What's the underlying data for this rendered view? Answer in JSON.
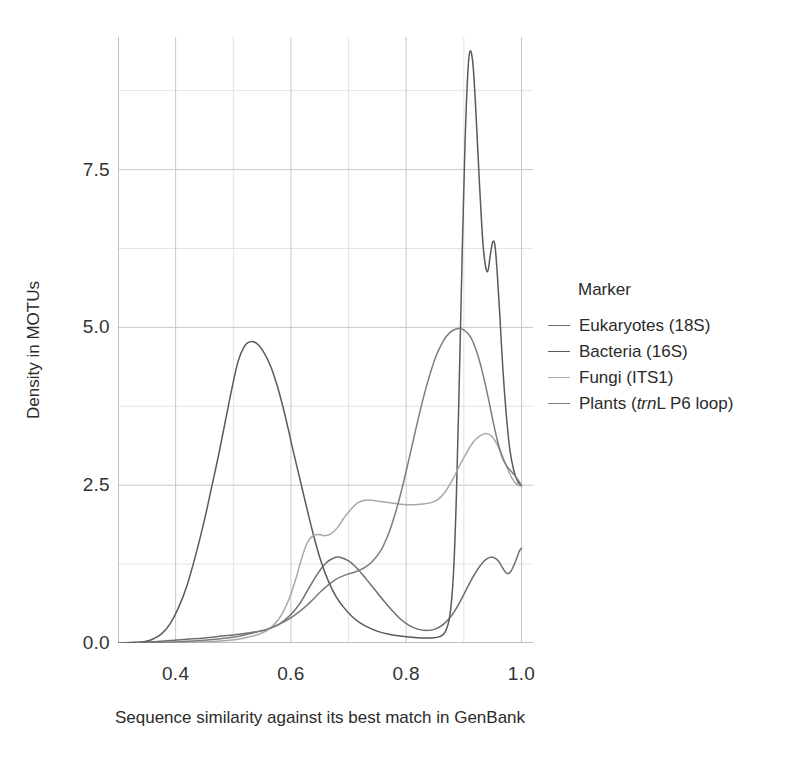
{
  "chart_data": {
    "type": "line",
    "title": "",
    "xlabel": "Sequence similarity against its best match in GenBank",
    "ylabel": "Density in MOTUs",
    "xlim": [
      0.3,
      1.02
    ],
    "ylim": [
      0.0,
      9.6
    ],
    "xticks": [
      0.4,
      0.6,
      0.8,
      1.0
    ],
    "xtick_labels": [
      "0.4",
      "0.6",
      "0.8",
      "1.0"
    ],
    "yticks": [
      0.0,
      2.5,
      5.0,
      7.5
    ],
    "ytick_labels": [
      "0.0",
      "2.5",
      "5.0",
      "7.5"
    ],
    "x_minor_ticks": [
      0.3,
      0.5,
      0.7,
      0.9
    ],
    "y_minor_ticks": [
      1.25,
      3.75,
      6.25,
      8.75
    ],
    "grid": true,
    "grid_color": "#c9c9c9",
    "legend_position": "right",
    "legend_title": "Marker",
    "series": [
      {
        "name": "Eukaryotes (18S)",
        "color": "#6e6e6e",
        "points": [
          [
            0.3,
            0.0
          ],
          [
            0.33,
            0.01
          ],
          [
            0.36,
            0.02
          ],
          [
            0.39,
            0.04
          ],
          [
            0.42,
            0.06
          ],
          [
            0.45,
            0.08
          ],
          [
            0.48,
            0.11
          ],
          [
            0.51,
            0.14
          ],
          [
            0.54,
            0.18
          ],
          [
            0.56,
            0.22
          ],
          [
            0.58,
            0.3
          ],
          [
            0.6,
            0.45
          ],
          [
            0.615,
            0.62
          ],
          [
            0.63,
            0.85
          ],
          [
            0.645,
            1.08
          ],
          [
            0.66,
            1.26
          ],
          [
            0.675,
            1.35
          ],
          [
            0.685,
            1.36
          ],
          [
            0.7,
            1.3
          ],
          [
            0.715,
            1.18
          ],
          [
            0.73,
            1.02
          ],
          [
            0.745,
            0.85
          ],
          [
            0.76,
            0.68
          ],
          [
            0.775,
            0.52
          ],
          [
            0.79,
            0.38
          ],
          [
            0.805,
            0.28
          ],
          [
            0.82,
            0.22
          ],
          [
            0.835,
            0.2
          ],
          [
            0.85,
            0.22
          ],
          [
            0.865,
            0.3
          ],
          [
            0.88,
            0.45
          ],
          [
            0.895,
            0.68
          ],
          [
            0.91,
            0.95
          ],
          [
            0.925,
            1.18
          ],
          [
            0.938,
            1.32
          ],
          [
            0.95,
            1.36
          ],
          [
            0.96,
            1.3
          ],
          [
            0.968,
            1.18
          ],
          [
            0.975,
            1.1
          ],
          [
            0.982,
            1.14
          ],
          [
            0.99,
            1.3
          ],
          [
            0.996,
            1.45
          ],
          [
            1.0,
            1.5
          ]
        ]
      },
      {
        "name": "Bacteria (16S)",
        "color": "#5a5a5a",
        "points": [
          [
            0.32,
            0.0
          ],
          [
            0.345,
            0.02
          ],
          [
            0.36,
            0.06
          ],
          [
            0.375,
            0.14
          ],
          [
            0.39,
            0.3
          ],
          [
            0.405,
            0.56
          ],
          [
            0.42,
            0.92
          ],
          [
            0.435,
            1.4
          ],
          [
            0.45,
            1.95
          ],
          [
            0.462,
            2.45
          ],
          [
            0.475,
            3.0
          ],
          [
            0.487,
            3.55
          ],
          [
            0.498,
            4.05
          ],
          [
            0.508,
            4.45
          ],
          [
            0.518,
            4.68
          ],
          [
            0.528,
            4.77
          ],
          [
            0.54,
            4.75
          ],
          [
            0.552,
            4.62
          ],
          [
            0.565,
            4.38
          ],
          [
            0.578,
            4.02
          ],
          [
            0.59,
            3.6
          ],
          [
            0.602,
            3.12
          ],
          [
            0.615,
            2.62
          ],
          [
            0.628,
            2.12
          ],
          [
            0.64,
            1.68
          ],
          [
            0.652,
            1.3
          ],
          [
            0.665,
            0.98
          ],
          [
            0.678,
            0.74
          ],
          [
            0.692,
            0.56
          ],
          [
            0.706,
            0.42
          ],
          [
            0.72,
            0.32
          ],
          [
            0.736,
            0.24
          ],
          [
            0.752,
            0.18
          ],
          [
            0.77,
            0.14
          ],
          [
            0.79,
            0.11
          ],
          [
            0.81,
            0.09
          ],
          [
            0.828,
            0.08
          ],
          [
            0.845,
            0.08
          ],
          [
            0.858,
            0.1
          ],
          [
            0.868,
            0.18
          ],
          [
            0.876,
            0.45
          ],
          [
            0.882,
            1.1
          ],
          [
            0.887,
            2.3
          ],
          [
            0.892,
            4.1
          ],
          [
            0.897,
            6.1
          ],
          [
            0.902,
            7.9
          ],
          [
            0.907,
            9.05
          ],
          [
            0.911,
            9.38
          ],
          [
            0.916,
            9.15
          ],
          [
            0.921,
            8.4
          ],
          [
            0.927,
            7.3
          ],
          [
            0.933,
            6.35
          ],
          [
            0.938,
            5.95
          ],
          [
            0.942,
            5.9
          ],
          [
            0.946,
            6.15
          ],
          [
            0.95,
            6.35
          ],
          [
            0.954,
            6.3
          ],
          [
            0.958,
            5.85
          ],
          [
            0.963,
            5.1
          ],
          [
            0.968,
            4.3
          ],
          [
            0.974,
            3.58
          ],
          [
            0.98,
            3.05
          ],
          [
            0.987,
            2.72
          ],
          [
            0.994,
            2.55
          ],
          [
            1.0,
            2.5
          ]
        ]
      },
      {
        "name": "Fungi (ITS1)",
        "color": "#a8a8a8",
        "points": [
          [
            0.385,
            0.0
          ],
          [
            0.42,
            0.01
          ],
          [
            0.455,
            0.02
          ],
          [
            0.49,
            0.04
          ],
          [
            0.52,
            0.08
          ],
          [
            0.545,
            0.14
          ],
          [
            0.565,
            0.24
          ],
          [
            0.582,
            0.42
          ],
          [
            0.596,
            0.68
          ],
          [
            0.608,
            1.0
          ],
          [
            0.618,
            1.32
          ],
          [
            0.628,
            1.58
          ],
          [
            0.638,
            1.7
          ],
          [
            0.648,
            1.72
          ],
          [
            0.658,
            1.7
          ],
          [
            0.668,
            1.72
          ],
          [
            0.68,
            1.82
          ],
          [
            0.692,
            1.98
          ],
          [
            0.704,
            2.12
          ],
          [
            0.716,
            2.22
          ],
          [
            0.728,
            2.26
          ],
          [
            0.74,
            2.26
          ],
          [
            0.755,
            2.24
          ],
          [
            0.772,
            2.22
          ],
          [
            0.79,
            2.2
          ],
          [
            0.808,
            2.19
          ],
          [
            0.825,
            2.2
          ],
          [
            0.842,
            2.22
          ],
          [
            0.856,
            2.28
          ],
          [
            0.868,
            2.4
          ],
          [
            0.88,
            2.58
          ],
          [
            0.892,
            2.8
          ],
          [
            0.904,
            3.0
          ],
          [
            0.916,
            3.18
          ],
          [
            0.928,
            3.28
          ],
          [
            0.938,
            3.32
          ],
          [
            0.948,
            3.28
          ],
          [
            0.957,
            3.16
          ],
          [
            0.966,
            2.98
          ],
          [
            0.975,
            2.78
          ],
          [
            0.983,
            2.62
          ],
          [
            0.991,
            2.52
          ],
          [
            1.0,
            2.48
          ]
        ]
      },
      {
        "name": "Plants (trnL P6 loop)",
        "color": "#7d7d7d",
        "points": [
          [
            0.33,
            0.0
          ],
          [
            0.38,
            0.01
          ],
          [
            0.43,
            0.03
          ],
          [
            0.47,
            0.06
          ],
          [
            0.505,
            0.1
          ],
          [
            0.535,
            0.16
          ],
          [
            0.56,
            0.22
          ],
          [
            0.58,
            0.3
          ],
          [
            0.6,
            0.4
          ],
          [
            0.618,
            0.52
          ],
          [
            0.635,
            0.66
          ],
          [
            0.65,
            0.8
          ],
          [
            0.665,
            0.92
          ],
          [
            0.68,
            1.02
          ],
          [
            0.695,
            1.08
          ],
          [
            0.71,
            1.12
          ],
          [
            0.725,
            1.18
          ],
          [
            0.74,
            1.28
          ],
          [
            0.755,
            1.45
          ],
          [
            0.768,
            1.7
          ],
          [
            0.78,
            2.02
          ],
          [
            0.792,
            2.42
          ],
          [
            0.804,
            2.88
          ],
          [
            0.816,
            3.36
          ],
          [
            0.828,
            3.82
          ],
          [
            0.84,
            4.22
          ],
          [
            0.852,
            4.55
          ],
          [
            0.864,
            4.78
          ],
          [
            0.876,
            4.92
          ],
          [
            0.888,
            4.98
          ],
          [
            0.9,
            4.96
          ],
          [
            0.912,
            4.84
          ],
          [
            0.922,
            4.62
          ],
          [
            0.932,
            4.3
          ],
          [
            0.942,
            3.9
          ],
          [
            0.951,
            3.5
          ],
          [
            0.959,
            3.18
          ],
          [
            0.966,
            2.96
          ],
          [
            0.973,
            2.82
          ],
          [
            0.98,
            2.74
          ],
          [
            0.988,
            2.66
          ],
          [
            0.994,
            2.58
          ],
          [
            1.0,
            2.5
          ]
        ]
      }
    ]
  }
}
